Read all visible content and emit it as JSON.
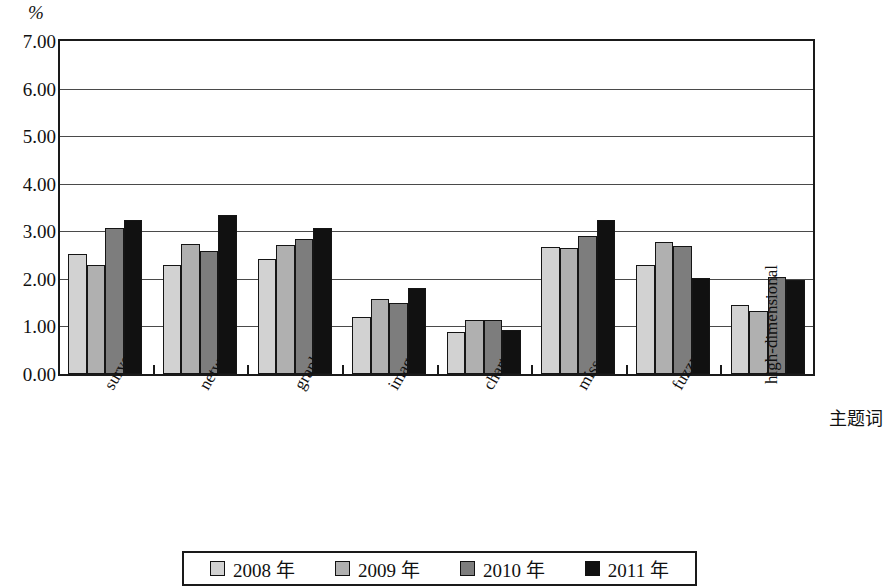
{
  "chart_data": {
    "type": "bar",
    "title": "",
    "subtitle": "",
    "unit_label": "%",
    "xlabel": "主题词",
    "ylabel": "%",
    "ylim": [
      0.0,
      7.0
    ],
    "yticks": [
      "0.00",
      "1.00",
      "2.00",
      "3.00",
      "4.00",
      "5.00",
      "6.00",
      "7.00"
    ],
    "ytick_values": [
      0.0,
      1.0,
      2.0,
      3.0,
      4.0,
      5.0,
      6.0,
      7.0
    ],
    "grid": true,
    "legend_position": "bottom",
    "categories": [
      "survey",
      "network",
      "graph",
      "image",
      "chart",
      "miss",
      "fuzzy",
      "high-dimensional"
    ],
    "series": [
      {
        "name": "2008 年",
        "color": "#d2d2d2",
        "values": [
          2.53,
          2.3,
          2.42,
          1.19,
          0.88,
          2.68,
          2.29,
          1.46
        ]
      },
      {
        "name": "2009 年",
        "color": "#b0b0b0",
        "values": [
          2.3,
          2.73,
          2.72,
          1.58,
          1.14,
          2.65,
          2.78,
          1.33
        ]
      },
      {
        "name": "2010 年",
        "color": "#7d7d7d",
        "values": [
          3.07,
          2.58,
          2.83,
          1.5,
          1.14,
          2.9,
          2.69,
          2.03
        ]
      },
      {
        "name": "2011 年",
        "color": "#111111",
        "values": [
          3.24,
          3.35,
          3.07,
          1.81,
          0.92,
          3.24,
          2.02,
          1.98
        ]
      }
    ]
  },
  "legend": {
    "items": [
      {
        "label": "2008 年"
      },
      {
        "label": "2009 年"
      },
      {
        "label": "2010 年"
      },
      {
        "label": "2011 年"
      }
    ]
  },
  "axes": {
    "unit": "%",
    "x_axis_title": "主题词"
  }
}
